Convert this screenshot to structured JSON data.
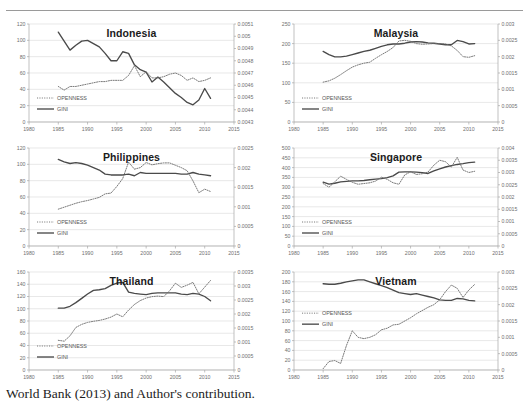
{
  "figure": {
    "caption": "World Bank (2013) and Author's contribution.",
    "series_names": {
      "openness": "OPENNESS",
      "gini": "GINI"
    },
    "colors": {
      "gini_line": "#4a4a4a",
      "openness_line": "#6b6b6b",
      "grid": "#d9d9d9",
      "axis": "#a6a6a6",
      "title": "#1b1b1b"
    }
  },
  "chart_data": [
    {
      "type": "line",
      "title": "Indonesia",
      "xlabel": "",
      "ylabel": "",
      "xlim": [
        1980,
        2015
      ],
      "xticks": [
        1980,
        1985,
        1990,
        1995,
        2000,
        2005,
        2010,
        2015
      ],
      "ylim": [
        0,
        120
      ],
      "yticks": [
        0,
        20,
        40,
        60,
        80,
        100,
        120
      ],
      "y2lim": [
        0.0043,
        0.0051
      ],
      "y2ticks": [
        0.0043,
        0.0044,
        0.0045,
        0.0046,
        0.0047,
        0.0048,
        0.0049,
        0.005,
        0.0051
      ],
      "grid": true,
      "legend": "inside-lower-left",
      "x": [
        1985,
        1986,
        1987,
        1988,
        1989,
        1990,
        1991,
        1992,
        1993,
        1994,
        1995,
        1996,
        1997,
        1998,
        1999,
        2000,
        2001,
        2002,
        2003,
        2004,
        2005,
        2006,
        2007,
        2008,
        2009,
        2010,
        2011
      ],
      "series": [
        {
          "name": "GINI",
          "axis": "left",
          "style": "solid",
          "values": [
            110,
            99,
            88,
            94,
            99,
            100,
            96,
            92,
            84,
            75,
            75,
            86,
            84,
            70,
            64,
            61,
            49,
            55,
            49,
            42,
            35,
            30,
            24,
            21,
            27,
            41,
            29
          ]
        },
        {
          "name": "OPENNESS",
          "axis": "right",
          "style": "dotted",
          "values": [
            0.00459,
            0.00456,
            0.00459,
            0.00459,
            0.0046,
            0.00461,
            0.00462,
            0.00463,
            0.00463,
            0.00464,
            0.00464,
            0.00464,
            0.00468,
            0.00476,
            0.00467,
            0.00471,
            0.00466,
            0.00466,
            0.00467,
            0.00469,
            0.0047,
            0.00468,
            0.00464,
            0.00466,
            0.00463,
            0.00464,
            0.00466
          ]
        }
      ]
    },
    {
      "type": "line",
      "title": "Malaysia",
      "xlabel": "",
      "ylabel": "",
      "xlim": [
        1980,
        2015
      ],
      "xticks": [
        1980,
        1985,
        1990,
        1995,
        2000,
        2005,
        2010,
        2015
      ],
      "ylim": [
        0,
        250
      ],
      "yticks": [
        0,
        50,
        100,
        150,
        200,
        250
      ],
      "y2lim": [
        0,
        0.003
      ],
      "y2ticks": [
        0,
        0.0005,
        0.001,
        0.0015,
        0.002,
        0.0025,
        0.003
      ],
      "grid": true,
      "legend": "inside-lower-left",
      "x": [
        1985,
        1986,
        1987,
        1988,
        1989,
        1990,
        1991,
        1992,
        1993,
        1994,
        1995,
        1996,
        1997,
        1998,
        1999,
        2000,
        2001,
        2002,
        2003,
        2004,
        2005,
        2006,
        2007,
        2008,
        2009,
        2010,
        2011
      ],
      "series": [
        {
          "name": "GINI",
          "axis": "left",
          "style": "solid",
          "values": [
            180,
            172,
            166,
            166,
            168,
            172,
            176,
            180,
            183,
            188,
            193,
            197,
            199,
            199,
            201,
            204,
            205,
            204,
            202,
            201,
            199,
            197,
            197,
            208,
            205,
            199,
            200
          ]
        },
        {
          "name": "OPENNESS",
          "axis": "right",
          "style": "dotted",
          "values": [
            0.00122,
            0.00126,
            0.00134,
            0.00145,
            0.00157,
            0.00168,
            0.00175,
            0.0018,
            0.00183,
            0.00195,
            0.00206,
            0.00216,
            0.00228,
            0.00248,
            0.0025,
            0.00247,
            0.0024,
            0.00238,
            0.00239,
            0.0024,
            0.0024,
            0.00239,
            0.00233,
            0.00219,
            0.002,
            0.00198,
            0.00203
          ]
        }
      ]
    },
    {
      "type": "line",
      "title": "Philippines",
      "xlabel": "",
      "ylabel": "",
      "xlim": [
        1980,
        2015
      ],
      "xticks": [
        1980,
        1985,
        1990,
        1995,
        2000,
        2005,
        2010,
        2015
      ],
      "ylim": [
        0,
        120
      ],
      "yticks": [
        0,
        20,
        40,
        60,
        80,
        100,
        120
      ],
      "y2lim": [
        0,
        0.0025
      ],
      "y2ticks": [
        0,
        0.0005,
        0.001,
        0.0015,
        0.002,
        0.0025
      ],
      "grid": true,
      "legend": "inside-lower-left",
      "x": [
        1985,
        1986,
        1987,
        1988,
        1989,
        1990,
        1991,
        1992,
        1993,
        1994,
        1995,
        1996,
        1997,
        1998,
        1999,
        2000,
        2001,
        2002,
        2003,
        2004,
        2005,
        2006,
        2007,
        2008,
        2009,
        2010,
        2011
      ],
      "series": [
        {
          "name": "GINI",
          "axis": "left",
          "style": "solid",
          "values": [
            106,
            103,
            101,
            102,
            101,
            99,
            96,
            93,
            88,
            87,
            87,
            87,
            88,
            86,
            90,
            89,
            89,
            89,
            89,
            89,
            89,
            88,
            88,
            90,
            88,
            87,
            86
          ]
        },
        {
          "name": "OPENNESS",
          "axis": "right",
          "style": "dotted",
          "values": [
            0.00094,
            0.00099,
            0.00104,
            0.00109,
            0.00113,
            0.00116,
            0.0012,
            0.00124,
            0.00133,
            0.00135,
            0.00152,
            0.00172,
            0.00214,
            0.00196,
            0.002,
            0.00213,
            0.00207,
            0.0021,
            0.00212,
            0.00212,
            0.00206,
            0.002,
            0.00192,
            0.00166,
            0.00136,
            0.00145,
            0.00139
          ]
        }
      ]
    },
    {
      "type": "line",
      "title": "Singapore",
      "xlabel": "",
      "ylabel": "",
      "xlim": [
        1980,
        2015
      ],
      "xticks": [
        1980,
        1985,
        1990,
        1995,
        2000,
        2005,
        2010,
        2015
      ],
      "ylim": [
        0,
        500
      ],
      "yticks": [
        0,
        50,
        100,
        150,
        200,
        250,
        300,
        350,
        400,
        450,
        500
      ],
      "y2lim": [
        0,
        0.004
      ],
      "y2ticks": [
        0,
        0.0005,
        0.001,
        0.0015,
        0.002,
        0.0025,
        0.003,
        0.0035,
        0.004
      ],
      "grid": true,
      "legend": "inside-lower-left",
      "x": [
        1985,
        1986,
        1987,
        1988,
        1989,
        1990,
        1991,
        1992,
        1993,
        1994,
        1995,
        1996,
        1997,
        1998,
        1999,
        2000,
        2001,
        2002,
        2003,
        2004,
        2005,
        2006,
        2007,
        2008,
        2009,
        2010,
        2011
      ],
      "series": [
        {
          "name": "GINI",
          "axis": "left",
          "style": "solid",
          "values": [
            326,
            316,
            320,
            327,
            330,
            332,
            332,
            334,
            338,
            341,
            344,
            349,
            358,
            377,
            378,
            378,
            377,
            374,
            370,
            383,
            394,
            403,
            410,
            416,
            420,
            425,
            428
          ]
        },
        {
          "name": "OPENNESS",
          "axis": "right",
          "style": "dotted",
          "values": [
            0.00255,
            0.0024,
            0.00262,
            0.00285,
            0.00272,
            0.0026,
            0.00252,
            0.00255,
            0.00258,
            0.00265,
            0.00281,
            0.00272,
            0.00258,
            0.00252,
            0.0029,
            0.00303,
            0.00292,
            0.00295,
            0.00302,
            0.0033,
            0.0035,
            0.00344,
            0.00322,
            0.00362,
            0.0031,
            0.003,
            0.00305
          ]
        }
      ]
    },
    {
      "type": "line",
      "title": "Thailand",
      "xlabel": "",
      "ylabel": "",
      "xlim": [
        1980,
        2015
      ],
      "xticks": [
        1980,
        1985,
        1990,
        1995,
        2000,
        2005,
        2010,
        2015
      ],
      "ylim": [
        0,
        160
      ],
      "yticks": [
        0,
        20,
        40,
        60,
        80,
        100,
        120,
        140,
        160
      ],
      "y2lim": [
        0,
        0.0035
      ],
      "y2ticks": [
        0,
        0.0005,
        0.001,
        0.0015,
        0.002,
        0.0025,
        0.003,
        0.0035
      ],
      "grid": true,
      "legend": "inside-lower-left",
      "x": [
        1985,
        1986,
        1987,
        1988,
        1989,
        1990,
        1991,
        1992,
        1993,
        1994,
        1995,
        1996,
        1997,
        1998,
        1999,
        2000,
        2001,
        2002,
        2003,
        2004,
        2005,
        2006,
        2007,
        2008,
        2009,
        2010,
        2011
      ],
      "series": [
        {
          "name": "GINI",
          "axis": "left",
          "style": "solid",
          "values": [
            101,
            101,
            104,
            110,
            117,
            124,
            130,
            131,
            133,
            138,
            142,
            143,
            127,
            125,
            124,
            123,
            125,
            126,
            126,
            126,
            126,
            124,
            123,
            125,
            124,
            120,
            113
          ]
        },
        {
          "name": "OPENNESS",
          "axis": "right",
          "style": "dotted",
          "values": [
            0.00106,
            0.00103,
            0.00122,
            0.00152,
            0.00163,
            0.0017,
            0.00174,
            0.00177,
            0.00182,
            0.00189,
            0.002,
            0.0019,
            0.00214,
            0.00234,
            0.00248,
            0.00257,
            0.00262,
            0.00264,
            0.00262,
            0.00283,
            0.0031,
            0.00295,
            0.00303,
            0.00313,
            0.00272,
            0.00296,
            0.0032
          ]
        }
      ]
    },
    {
      "type": "line",
      "title": "Vietnam",
      "xlabel": "",
      "ylabel": "",
      "xlim": [
        1980,
        2015
      ],
      "xticks": [
        1980,
        1985,
        1990,
        1995,
        2000,
        2005,
        2010,
        2015
      ],
      "ylim": [
        0,
        200
      ],
      "yticks": [
        0,
        20,
        40,
        60,
        80,
        100,
        120,
        140,
        160,
        180,
        200
      ],
      "y2lim": [
        0,
        0.003
      ],
      "y2ticks": [
        0,
        0.0005,
        0.001,
        0.0015,
        0.002,
        0.0025,
        0.003
      ],
      "grid": true,
      "legend": "inside-upper-left",
      "x": [
        1985,
        1986,
        1987,
        1988,
        1989,
        1990,
        1991,
        1992,
        1993,
        1994,
        1995,
        1996,
        1997,
        1998,
        1999,
        2000,
        2001,
        2002,
        2003,
        2004,
        2005,
        2006,
        2007,
        2008,
        2009,
        2010,
        2011
      ],
      "series": [
        {
          "name": "GINI",
          "axis": "left",
          "style": "solid",
          "values": [
            176,
            175,
            175,
            177,
            180,
            182,
            184,
            184,
            180,
            176,
            172,
            168,
            163,
            158,
            156,
            154,
            156,
            153,
            150,
            147,
            143,
            142,
            142,
            146,
            145,
            142,
            141
          ]
        },
        {
          "name": "OPENNESS",
          "axis": "right",
          "style": "dotted",
          "values": [
            4e-05,
            0.00026,
            0.00029,
            0.0002,
            0.00075,
            0.0012,
            0.001,
            0.00096,
            0.001,
            0.00108,
            0.00123,
            0.00128,
            0.00138,
            0.0014,
            0.0015,
            0.0016,
            0.00172,
            0.00182,
            0.00192,
            0.002,
            0.00215,
            0.0024,
            0.0026,
            0.0025,
            0.00222,
            0.00245,
            0.00262
          ]
        }
      ]
    }
  ]
}
